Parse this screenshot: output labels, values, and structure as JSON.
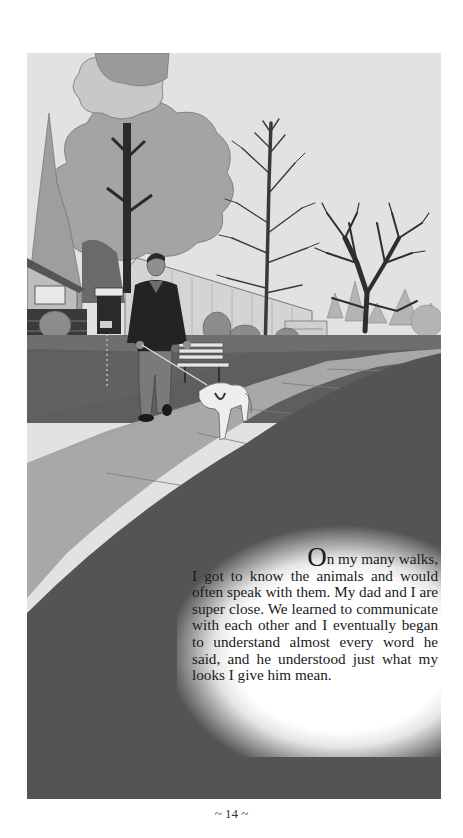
{
  "page": {
    "illustration": {
      "description": "Man in dark sweater walking a white dog on a leash along a sidewalk past a bench, trees, a parking meter sign, houses and a white building",
      "palette": {
        "sky": "#e2e2e2",
        "foliage_light": "#a8a8a8",
        "foliage_mid": "#8a8a8a",
        "grass": "#5e5e5e",
        "road": "#555555",
        "sidewalk": "#a0a0a0",
        "building": "#d0d0d0",
        "dark": "#222222"
      }
    },
    "story": {
      "drop_cap": "O",
      "first_line_rest": "n my many walks,",
      "body": "I got to know the animals and would often speak with them. My dad and I are super close. We learned to communicate with each other and I eventually began to understand almost every word he said, and he understood just what my looks I give him mean."
    },
    "page_number": "~ 14 ~"
  }
}
